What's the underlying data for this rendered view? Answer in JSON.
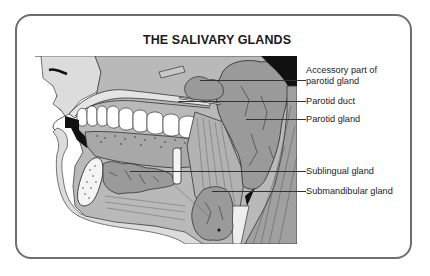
{
  "title": "THE SALIVARY GLANDS",
  "labels": [
    {
      "id": "accessory-parotid",
      "lines": [
        "Accessory part of",
        "parotid gland"
      ]
    },
    {
      "id": "parotid-duct",
      "text": "Parotid duct"
    },
    {
      "id": "parotid-gland",
      "text": "Parotid gland"
    },
    {
      "id": "sublingual-gland",
      "text": "Sublingual gland"
    },
    {
      "id": "submandibular-gland",
      "text": "Submandibular gland"
    }
  ],
  "colors": {
    "border": "#6e6e6e",
    "gland": "#9a9a9a",
    "tissue": "#b9b9b9",
    "skin": "#dcdcdc",
    "dark": "#111111"
  }
}
